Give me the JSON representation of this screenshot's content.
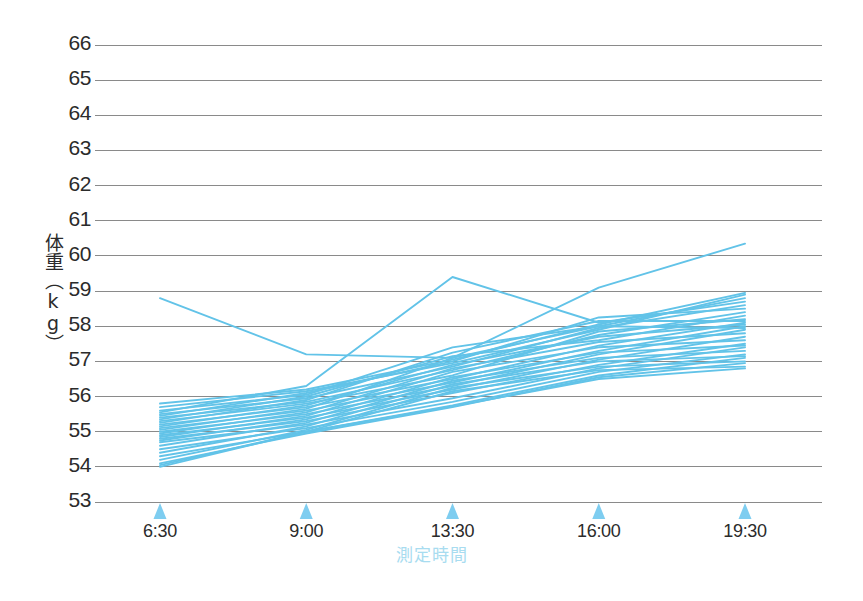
{
  "chart_data": {
    "type": "line",
    "title": "",
    "xlabel": "測定時間",
    "ylabel": "体重（kg）",
    "ylabel_chars": [
      "体",
      "重",
      "（",
      "kg",
      "）"
    ],
    "x": [
      "6:30",
      "9:00",
      "13:30",
      "16:00",
      "19:30"
    ],
    "categories": [
      "6:30",
      "9:00",
      "13:30",
      "16:00",
      "19:30"
    ],
    "ylim": [
      53,
      66
    ],
    "yticks": [
      53,
      54,
      55,
      56,
      57,
      58,
      59,
      60,
      61,
      62,
      63,
      64,
      65,
      66
    ],
    "grid": true,
    "legend": "none",
    "line_color": "#62c3e8",
    "axis_title_color": "#a8dcf0",
    "tick_marker_color": "#7ecdf0",
    "gridline_color": "#8a8a8a",
    "series": [
      {
        "name": "subject-01",
        "values": [
          58.8,
          57.2,
          57.1,
          59.1,
          60.35
        ]
      },
      {
        "name": "subject-02",
        "values": [
          55.8,
          56.2,
          57.05,
          58.05,
          58.95
        ]
      },
      {
        "name": "subject-03",
        "values": [
          55.7,
          56.15,
          56.95,
          57.9,
          58.9
        ]
      },
      {
        "name": "subject-04",
        "values": [
          55.6,
          56.05,
          57.4,
          58.0,
          58.8
        ]
      },
      {
        "name": "subject-05",
        "values": [
          55.55,
          56.3,
          59.4,
          58.1,
          58.7
        ]
      },
      {
        "name": "subject-06",
        "values": [
          55.5,
          55.95,
          56.85,
          57.95,
          58.6
        ]
      },
      {
        "name": "subject-07",
        "values": [
          55.45,
          56.1,
          57.0,
          58.25,
          58.5
        ]
      },
      {
        "name": "subject-08",
        "values": [
          55.4,
          55.85,
          56.75,
          57.75,
          58.4
        ]
      },
      {
        "name": "subject-09",
        "values": [
          55.35,
          56.0,
          57.15,
          57.6,
          58.3
        ]
      },
      {
        "name": "subject-10",
        "values": [
          55.3,
          55.8,
          56.6,
          57.85,
          58.2
        ]
      },
      {
        "name": "subject-11",
        "values": [
          55.25,
          55.9,
          57.25,
          58.15,
          58.15
        ]
      },
      {
        "name": "subject-12",
        "values": [
          55.2,
          55.7,
          56.5,
          57.45,
          58.1
        ]
      },
      {
        "name": "subject-13",
        "values": [
          55.15,
          55.75,
          56.9,
          57.7,
          58.05
        ]
      },
      {
        "name": "subject-14",
        "values": [
          55.1,
          55.6,
          56.4,
          57.3,
          58.0
        ]
      },
      {
        "name": "subject-15",
        "values": [
          55.05,
          55.65,
          57.1,
          58.0,
          57.95
        ]
      },
      {
        "name": "subject-16",
        "values": [
          55.0,
          55.5,
          56.3,
          57.2,
          57.9
        ]
      },
      {
        "name": "subject-17",
        "values": [
          54.95,
          55.55,
          56.8,
          57.55,
          57.8
        ]
      },
      {
        "name": "subject-18",
        "values": [
          54.9,
          55.4,
          56.2,
          57.05,
          57.7
        ]
      },
      {
        "name": "subject-19",
        "values": [
          54.85,
          55.45,
          56.7,
          57.4,
          57.6
        ]
      },
      {
        "name": "subject-20",
        "values": [
          54.8,
          55.3,
          56.1,
          56.9,
          57.5
        ]
      },
      {
        "name": "subject-21",
        "values": [
          54.75,
          55.35,
          56.55,
          57.25,
          57.45
        ]
      },
      {
        "name": "subject-22",
        "values": [
          54.7,
          55.2,
          55.95,
          56.8,
          57.4
        ]
      },
      {
        "name": "subject-23",
        "values": [
          54.6,
          55.25,
          56.45,
          57.1,
          57.3
        ]
      },
      {
        "name": "subject-24",
        "values": [
          54.5,
          55.1,
          55.85,
          56.7,
          57.2
        ]
      },
      {
        "name": "subject-25",
        "values": [
          54.4,
          55.15,
          56.35,
          57.0,
          57.15
        ]
      },
      {
        "name": "subject-26",
        "values": [
          54.3,
          55.0,
          55.75,
          56.6,
          57.1
        ]
      },
      {
        "name": "subject-27",
        "values": [
          54.2,
          55.05,
          56.25,
          56.85,
          57.0
        ]
      },
      {
        "name": "subject-28",
        "values": [
          54.1,
          54.95,
          55.7,
          56.55,
          56.95
        ]
      },
      {
        "name": "subject-29",
        "values": [
          54.05,
          55.0,
          56.15,
          56.75,
          56.85
        ]
      },
      {
        "name": "subject-30",
        "values": [
          54.0,
          55.0,
          55.72,
          56.5,
          56.8
        ]
      }
    ]
  }
}
